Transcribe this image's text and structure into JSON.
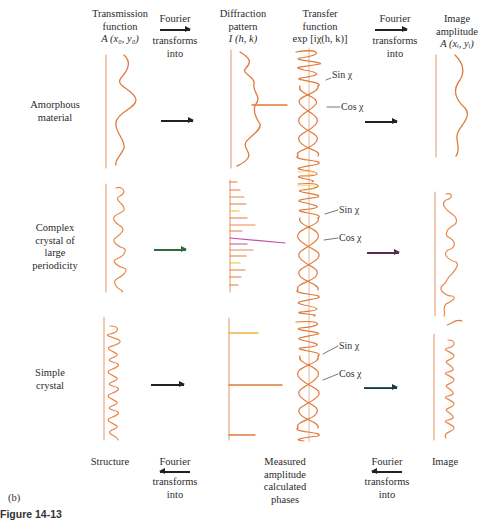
{
  "headers": {
    "transmission": [
      "Transmission",
      "function",
      "A (x₀, y₀)"
    ],
    "fourier_top_left": {
      "top": "Fourier",
      "bottom": [
        "transforms",
        "into"
      ]
    },
    "diffraction": [
      "Diffraction",
      "pattern",
      "I (h, k)"
    ],
    "transfer": [
      "Transfer",
      "function",
      "exp [iχ(h, k)]"
    ],
    "fourier_top_right": {
      "top": "Fourier",
      "bottom": [
        "transforms",
        "into"
      ]
    },
    "image": [
      "Image",
      "amplitude",
      "A (xᵢ, yᵢ)"
    ]
  },
  "rows": [
    {
      "label": [
        "Amorphous",
        "material"
      ],
      "sin_label": "Sin χ",
      "cos_label": "Cos χ"
    },
    {
      "label": [
        "Complex",
        "crystal of",
        "large",
        "periodicity"
      ],
      "sin_label": "Sin χ",
      "cos_label": "Cos χ"
    },
    {
      "label": [
        "Simple",
        "crystal"
      ],
      "sin_label": "Sin χ",
      "cos_label": "Cos χ"
    }
  ],
  "footers": {
    "structure": "Structure",
    "fourier_bottom_left": {
      "top": "Fourier",
      "bottom": [
        "transforms",
        "into"
      ]
    },
    "measured": [
      "Measured",
      "amplitude",
      "calculated",
      "phases"
    ],
    "fourier_bottom_right": {
      "top": "Fourier",
      "bottom": [
        "transforms",
        "into"
      ]
    },
    "image": "Image"
  },
  "panel_label": "(b)",
  "figure_caption": "Figure 14-13",
  "colors": {
    "curve": "#e07a3c",
    "axis": "#e8a77e",
    "accent_green_arrow": "#2f6a3a",
    "accent_purple": "#c050a0",
    "accent_yellow": "#f0c030"
  }
}
